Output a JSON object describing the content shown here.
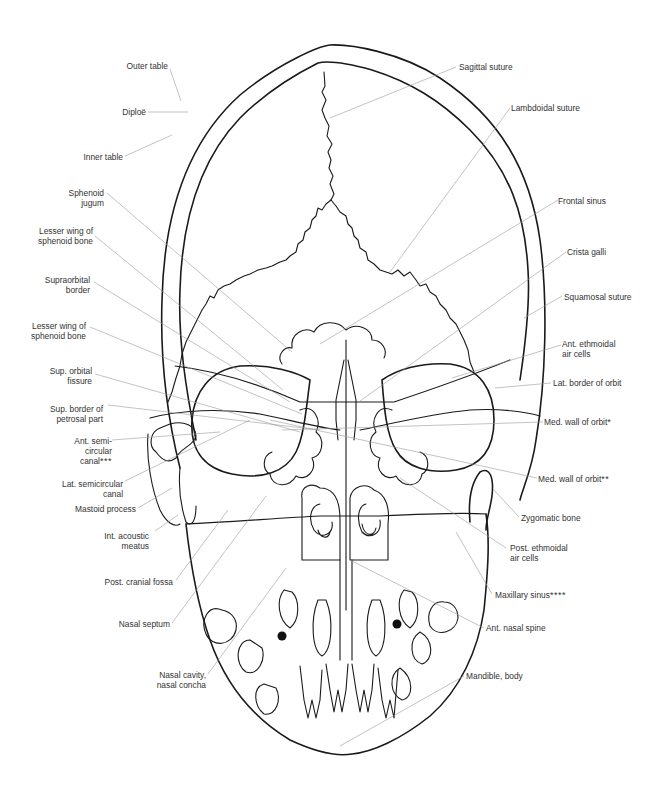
{
  "figure": {
    "line_color": "#1a1a1a",
    "leader_color": "#9a9a9a",
    "text_color": "#333333",
    "background": "#ffffff"
  },
  "labels_left": [
    {
      "id": "outer-table",
      "lines": [
        "Outer table"
      ],
      "stars": ""
    },
    {
      "id": "diploe",
      "lines": [
        "Diploë"
      ],
      "stars": ""
    },
    {
      "id": "inner-table",
      "lines": [
        "Inner table"
      ],
      "stars": ""
    },
    {
      "id": "sphenoid-jugum",
      "lines": [
        "Sphenoid",
        "jugum"
      ],
      "stars": ""
    },
    {
      "id": "lesser-wing-1",
      "lines": [
        "Lesser wing of",
        "sphenoid bone"
      ],
      "stars": ""
    },
    {
      "id": "supraorbital-border",
      "lines": [
        "Supraorbital",
        "border"
      ],
      "stars": ""
    },
    {
      "id": "lesser-wing-2",
      "lines": [
        "Lesser wing of",
        "sphenoid bone"
      ],
      "stars": ""
    },
    {
      "id": "sup-orbital-fissure",
      "lines": [
        "Sup. orbital",
        "fissure"
      ],
      "stars": ""
    },
    {
      "id": "sup-border-petrosal",
      "lines": [
        "Sup. border of",
        "petrosal part"
      ],
      "stars": ""
    },
    {
      "id": "ant-semicircular-canal",
      "lines": [
        "Ant. semi-",
        "circular",
        "canal"
      ],
      "stars": "***"
    },
    {
      "id": "lat-semicircular-canal",
      "lines": [
        "Lat. semicircular",
        "canal"
      ],
      "stars": ""
    },
    {
      "id": "mastoid-process",
      "lines": [
        "Mastoid process"
      ],
      "stars": ""
    },
    {
      "id": "int-acoustic-meatus",
      "lines": [
        "Int. acoustic",
        "meatus"
      ],
      "stars": ""
    },
    {
      "id": "post-cranial-fossa",
      "lines": [
        "Post. cranial fossa"
      ],
      "stars": ""
    },
    {
      "id": "nasal-septum",
      "lines": [
        "Nasal septum"
      ],
      "stars": ""
    },
    {
      "id": "nasal-cavity",
      "lines": [
        "Nasal cavity,",
        "nasal concha"
      ],
      "stars": ""
    }
  ],
  "labels_right": [
    {
      "id": "sagittal-suture",
      "lines": [
        "Sagittal suture"
      ],
      "stars": ""
    },
    {
      "id": "lambdoidal-suture",
      "lines": [
        "Lambdoidal suture"
      ],
      "stars": ""
    },
    {
      "id": "frontal-sinus",
      "lines": [
        "Frontal sinus"
      ],
      "stars": ""
    },
    {
      "id": "crista-galli",
      "lines": [
        "Crista galli"
      ],
      "stars": ""
    },
    {
      "id": "squamosal-suture",
      "lines": [
        "Squamosal suture"
      ],
      "stars": ""
    },
    {
      "id": "ant-ethmoidal",
      "lines": [
        "Ant. ethmoidal",
        "air cells"
      ],
      "stars": ""
    },
    {
      "id": "lat-border-orbit",
      "lines": [
        "Lat. border of orbit"
      ],
      "stars": ""
    },
    {
      "id": "med-wall-orbit-1",
      "lines": [
        "Med. wall of orbit"
      ],
      "stars": "*"
    },
    {
      "id": "med-wall-orbit-2",
      "lines": [
        "Med. wall of orbit"
      ],
      "stars": "**"
    },
    {
      "id": "zygomatic-bone",
      "lines": [
        "Zygomatic bone"
      ],
      "stars": ""
    },
    {
      "id": "post-ethmoidal",
      "lines": [
        "Post. ethmoidal",
        "air cells"
      ],
      "stars": ""
    },
    {
      "id": "maxillary-sinus",
      "lines": [
        "Maxillary sinus"
      ],
      "stars": "****"
    },
    {
      "id": "ant-nasal-spine",
      "lines": [
        "Ant. nasal spine"
      ],
      "stars": ""
    },
    {
      "id": "mandible-body",
      "lines": [
        "Mandible, body"
      ],
      "stars": ""
    }
  ]
}
